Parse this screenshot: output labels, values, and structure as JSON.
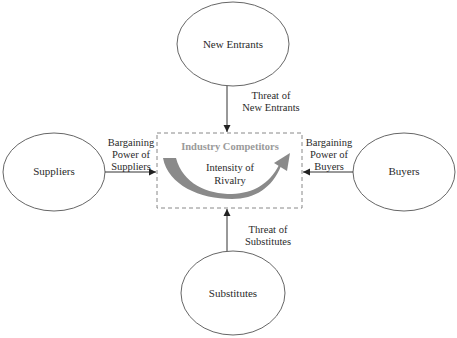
{
  "diagram": {
    "type": "Porter's Five Forces",
    "nodes": {
      "new_entrants": "New Entrants",
      "suppliers": "Suppliers",
      "buyers": "Buyers",
      "substitutes": "Substitutes"
    },
    "center": {
      "title": "Industry Competitors",
      "subtitle_line1": "Intensity of",
      "subtitle_line2": "Rivalry"
    },
    "edges": {
      "new_entrants": {
        "line1": "Threat of",
        "line2": "New Entrants"
      },
      "suppliers": {
        "line1": "Bargaining",
        "line2": "Power of",
        "line3": "Suppliers"
      },
      "buyers": {
        "line1": "Bargaining",
        "line2": "Power of",
        "line3": "Buyers"
      },
      "substitutes": {
        "line1": "Threat of",
        "line2": "Substitutes"
      }
    },
    "colors": {
      "stroke": "#555555",
      "dashed_box": "#888888",
      "rivalry_arrow": "#8a8a8a",
      "center_title": "#9a9a9a"
    }
  }
}
